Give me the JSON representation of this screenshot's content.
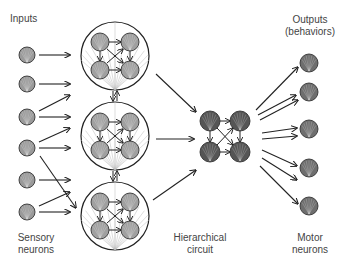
{
  "labels": {
    "inputs": "Inputs",
    "outputs_line1": "Outputs",
    "outputs_line2": "(behaviors)",
    "sensory_line1": "Sensory",
    "sensory_line2": "neurons",
    "hierarchical_line1": "Hierarchical",
    "hierarchical_line2": "circuit",
    "motor_line1": "Motor",
    "motor_line2": "neurons"
  },
  "colors": {
    "background": "#ffffff",
    "stroke": "#222222",
    "sensory_fill": "#9a9a9a",
    "module_neuron_fill": "#a0a0a0",
    "hierarchical_fill": "#555555",
    "motor_fill": "#6e6e6e",
    "fan_line": "#bbbbbb",
    "text": "#444444"
  },
  "diagram": {
    "sensory_neurons": [
      {
        "x": 27,
        "y": 55
      },
      {
        "x": 27,
        "y": 84
      },
      {
        "x": 27,
        "y": 117
      },
      {
        "x": 27,
        "y": 148
      },
      {
        "x": 27,
        "y": 180
      },
      {
        "x": 27,
        "y": 212
      }
    ],
    "modules": [
      {
        "x": 115,
        "y": 56,
        "r": 34
      },
      {
        "x": 115,
        "y": 136,
        "r": 34
      },
      {
        "x": 115,
        "y": 216,
        "r": 34
      }
    ],
    "hierarchical_nodes": [
      {
        "x": 210,
        "y": 121
      },
      {
        "x": 240,
        "y": 121
      },
      {
        "x": 210,
        "y": 152
      },
      {
        "x": 240,
        "y": 152
      }
    ],
    "motor_neurons": [
      {
        "x": 309,
        "y": 63
      },
      {
        "x": 309,
        "y": 92
      },
      {
        "x": 309,
        "y": 129
      },
      {
        "x": 309,
        "y": 168
      },
      {
        "x": 309,
        "y": 206
      }
    ]
  }
}
